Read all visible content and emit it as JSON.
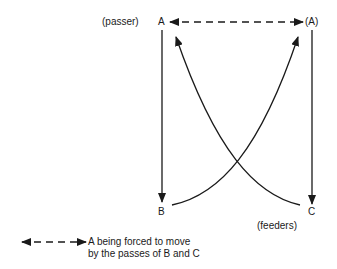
{
  "diagram": {
    "nodes": {
      "A": {
        "label": "A",
        "role_label": "(passer)"
      },
      "A_moved": {
        "label": "(A)"
      },
      "B": {
        "label": "B"
      },
      "C": {
        "label": "C",
        "role_label": "(feeders)"
      }
    },
    "edges": [
      {
        "from": "A",
        "to": "A_moved",
        "style": "dashed",
        "direction": "both"
      },
      {
        "from": "A",
        "to": "B",
        "style": "solid",
        "direction": "forward"
      },
      {
        "from": "A_moved",
        "to": "C",
        "style": "solid",
        "direction": "forward"
      },
      {
        "from": "C",
        "to": "A",
        "style": "solid-curve",
        "direction": "forward"
      },
      {
        "from": "B",
        "to": "A_moved",
        "style": "solid-curve",
        "direction": "forward"
      }
    ],
    "legend": {
      "line1": "A being forced to move",
      "line2": "by the passes of B and C"
    },
    "colors": {
      "ink": "#1a1a1a",
      "background": "#ffffff"
    }
  }
}
